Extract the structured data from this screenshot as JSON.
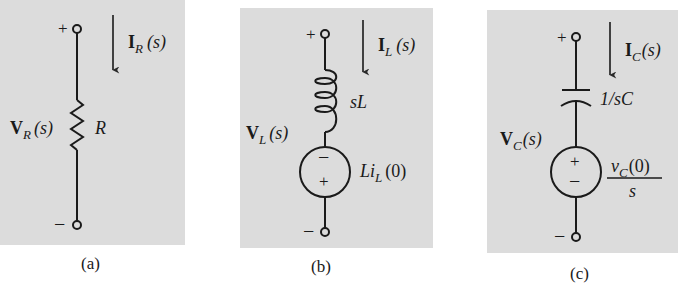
{
  "figure": {
    "panels": [
      {
        "id": "a",
        "caption": "(a)",
        "element": "resistor",
        "current_label": {
          "main": "I",
          "sub": "R",
          "arg": "(s)"
        },
        "voltage_label": {
          "main": "V",
          "sub": "R",
          "arg": "(s)"
        },
        "impedance_label": "R",
        "terminal_plus": "+",
        "terminal_minus": "−"
      },
      {
        "id": "b",
        "caption": "(b)",
        "element": "inductor",
        "current_label": {
          "main": "I",
          "sub": "L",
          "arg": "(s)"
        },
        "voltage_label": {
          "main": "V",
          "sub": "L",
          "arg": "(s)"
        },
        "impedance_label": "sL",
        "source_label": {
          "pre": "Li",
          "sub": "L",
          "arg": "(0)"
        },
        "source_top_sign": "−",
        "source_bottom_sign": "+",
        "terminal_plus": "+",
        "terminal_minus": "−"
      },
      {
        "id": "c",
        "caption": "(c)",
        "element": "capacitor",
        "current_label": {
          "main": "I",
          "sub": "C",
          "arg": "(s)"
        },
        "voltage_label": {
          "main": "V",
          "sub": "C",
          "arg": "(s)"
        },
        "impedance_label": "1/sC",
        "source_label": {
          "numerator_main": "v",
          "numerator_sub": "C",
          "numerator_arg": "(0)",
          "denominator": "s"
        },
        "source_top_sign": "+",
        "source_bottom_sign": "−",
        "terminal_plus": "+",
        "terminal_minus": "−"
      }
    ],
    "colors": {
      "panel_bg": "#dcdcdc",
      "ink": "#1a1a1a",
      "page_bg": "#ffffff"
    }
  }
}
